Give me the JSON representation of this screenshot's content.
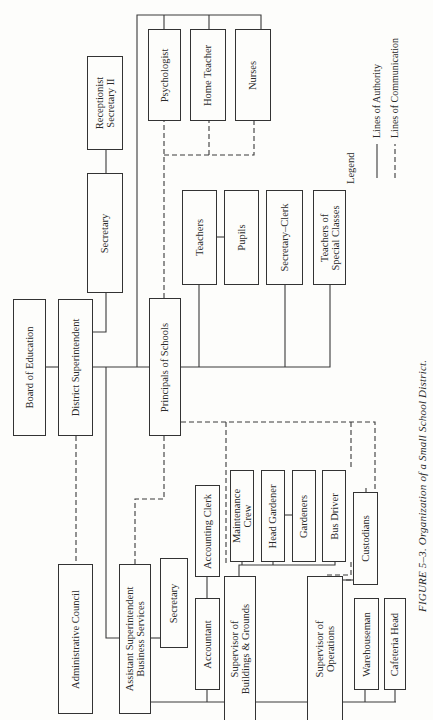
{
  "figure": {
    "caption": "FIGURE 5–3.   Organization of a Small School District.",
    "orientation": "rotated 90° counterclockwise"
  },
  "nodes": {
    "board": "Board of Education",
    "district_supt": "District Superintendent",
    "secretary_top": "Secretary",
    "receptionist": "Receptionist\nSecretary II",
    "admin_council": "Administrative Council",
    "principals": "Principals of Schools",
    "psychologist": "Psychologist",
    "home_teacher": "Home Teacher",
    "nurses": "Nurses",
    "teachers": "Teachers",
    "pupils": "Pupils",
    "secretary_clerk": "Secretary–Clerk",
    "teachers_special": "Teachers of\nSpecial Classes",
    "asst_supt": "Assistant Superintendent\nBusiness Services",
    "secretary_business": "Secretary",
    "accounting_clerk": "Accounting Clerk",
    "accountant": "Accountant",
    "sup_buildings": "Supervisor of\nBuildings & Grounds",
    "maintenance": "Maintenance\nCrew",
    "head_gardener": "Head Gardener",
    "gardeners": "Gardeners",
    "bus_driver": "Bus Driver",
    "custodians": "Custodians",
    "sup_operations": "Supervisor of\nOperations",
    "warehouseman": "Warehouseman",
    "cafeteria_head": "Cafeteria Head"
  },
  "legend": {
    "title": "Legend",
    "items": [
      {
        "style": "solid",
        "label": "Lines of Authority"
      },
      {
        "style": "dashed",
        "label": "Lines of Communication"
      }
    ]
  },
  "colors": {
    "line": "#333333",
    "background": "#fdfdfb"
  }
}
